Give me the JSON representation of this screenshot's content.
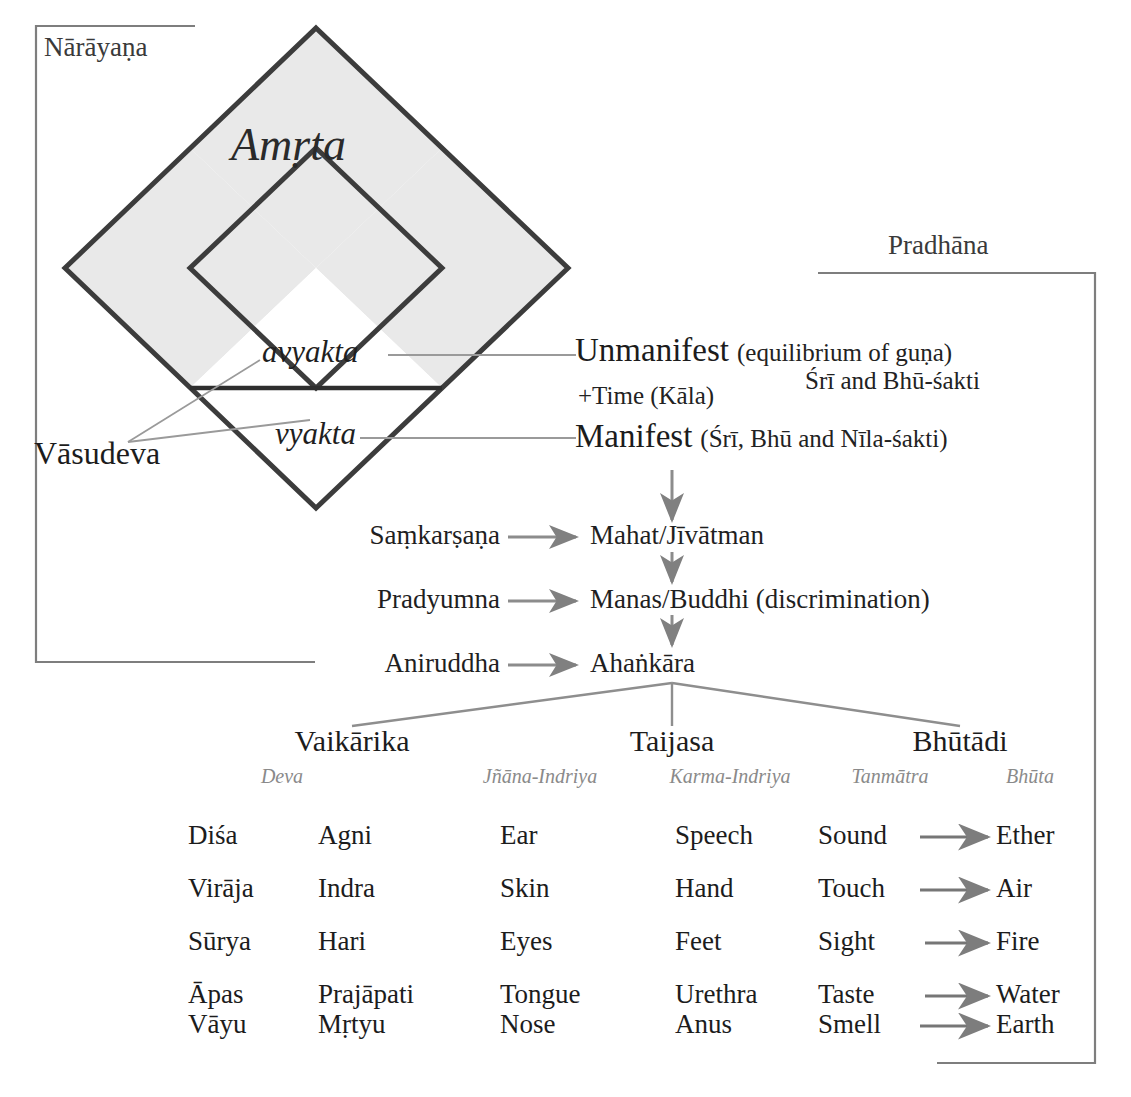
{
  "boxes": {
    "narayana_label": "Nārāyaṇa",
    "pradhana_label": "Pradhāna"
  },
  "diamond": {
    "center_label": "Amṛta",
    "avyakta_label": "avyakta",
    "vyakta_label": "vyakta",
    "vasudeva_label": "Vāsudeva",
    "time_label": "+Time (Kāla)"
  },
  "manifestation": {
    "unmanifest_main": "Unmanifest",
    "unmanifest_paren": "(equilibrium of guṇa)",
    "unmanifest_sub": "Śrī and Bhū-śakti",
    "manifest_main": "Manifest",
    "manifest_paren": "(Śrī, Bhū and Nīla-śakti)"
  },
  "vyuha_rows": [
    {
      "source": "Saṃkarṣaṇa",
      "target": "Mahat/Jīvātman"
    },
    {
      "source": "Pradyumna",
      "target": "Manas/Buddhi (discrimination)"
    },
    {
      "source": "Aniruddha",
      "target": "Ahaṅkāra"
    }
  ],
  "groups": [
    {
      "name": "Vaikārika"
    },
    {
      "name": "Taijasa"
    },
    {
      "name": "Bhūtādi"
    }
  ],
  "table": {
    "column_headers": [
      "",
      "Deva",
      "Jñāna-Indriya",
      "Karma-Indriya",
      "Tanmātra",
      "Bhūta"
    ],
    "rows": [
      {
        "c0": "Diśa",
        "c1": "Agni",
        "c2": "Ear",
        "c3": "Speech",
        "c4": "Sound",
        "c5": "Ether"
      },
      {
        "c0": "Virāja",
        "c1": "Indra",
        "c2": "Skin",
        "c3": "Hand",
        "c4": "Touch",
        "c5": "Air"
      },
      {
        "c0": "Sūrya",
        "c1": "Hari",
        "c2": "Eyes",
        "c3": "Feet",
        "c4": "Sight",
        "c5": "Fire"
      },
      {
        "c0": "Āpas",
        "c1": "Prajāpati",
        "c2": "Tongue",
        "c3": "Urethra",
        "c4": "Taste",
        "c5": "Water"
      },
      {
        "c0": "Vāyu",
        "c1": "Mṛtyu",
        "c2": "Nose",
        "c3": "Anus",
        "c4": "Smell",
        "c5": "Earth"
      }
    ]
  },
  "colors": {
    "ink": "#1c1c1c",
    "rule": "#8a8a8a",
    "diamond_stroke": "#3c3c3c",
    "diamond_fill": "#e9e9e9",
    "arrow": "#808080"
  }
}
